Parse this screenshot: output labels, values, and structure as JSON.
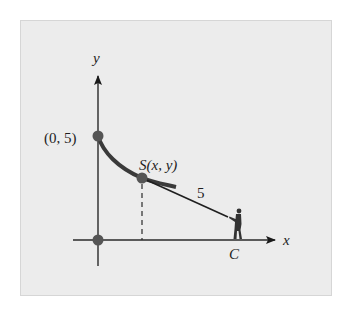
{
  "diagram": {
    "type": "tractrix-tow-diagram",
    "axes": {
      "x_label": "x",
      "y_label": "y"
    },
    "points": {
      "start": {
        "label": "(0, 5)"
      },
      "origin": {
        "label": ""
      },
      "s_point": {
        "label": "S(x, y)"
      },
      "c_point": {
        "label": "C"
      }
    },
    "segment_length_label": "5",
    "colors": {
      "background": "#ececec",
      "axis": "#2a2a2a",
      "curve": "#3a3a3a",
      "point": "#555555",
      "rope": "#1f1f1f",
      "figure": "#333333"
    }
  }
}
